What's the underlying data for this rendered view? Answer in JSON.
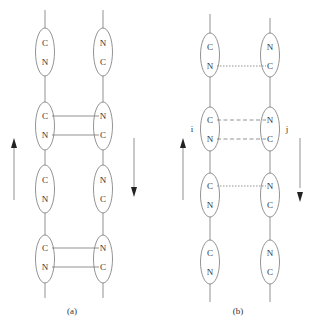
{
  "panels": [
    {
      "caption": "(a)",
      "left_strand": {
        "x": 45,
        "direction": "up",
        "units": [
          [
            "C",
            "N"
          ],
          [
            "C",
            "N"
          ],
          [
            "C",
            "N"
          ],
          [
            "C",
            "N"
          ]
        ]
      },
      "right_strand": {
        "x": 103,
        "direction": "down",
        "units": [
          [
            "N",
            "C"
          ],
          [
            "N",
            "C"
          ],
          [
            "N",
            "C"
          ],
          [
            "N",
            "C"
          ]
        ]
      },
      "bonds": [
        {
          "unit": 1,
          "style": "solid",
          "pairs": [
            [
              "C",
              "N"
            ],
            [
              "N",
              "C"
            ]
          ]
        },
        {
          "unit": 3,
          "style": "solid",
          "pairs": [
            [
              "C",
              "N"
            ],
            [
              "N",
              "C"
            ]
          ]
        }
      ]
    },
    {
      "caption": "(b)",
      "left_label": "i",
      "right_label": "j",
      "left_strand": {
        "x": 210,
        "direction": "up",
        "units": [
          [
            "C",
            "N"
          ],
          [
            "C",
            "N"
          ],
          [
            "C",
            "N"
          ],
          [
            "C",
            "N"
          ]
        ]
      },
      "right_strand": {
        "x": 270,
        "direction": "down",
        "units": [
          [
            "N",
            "C"
          ],
          [
            "N",
            "C"
          ],
          [
            "N",
            "C"
          ],
          [
            "N",
            "C"
          ]
        ]
      },
      "bonds": [
        {
          "unit": 0,
          "style": "dotted",
          "pairs": [
            [
              "N",
              "C"
            ]
          ]
        },
        {
          "unit": 1,
          "style": "dashed",
          "pairs": [
            [
              "C",
              "N"
            ],
            [
              "N",
              "C"
            ]
          ]
        },
        {
          "unit": 2,
          "style": "dotted",
          "pairs": [
            [
              "C",
              "N"
            ]
          ]
        }
      ]
    }
  ],
  "colors": {
    "line": "#777777",
    "text": "#333333"
  }
}
